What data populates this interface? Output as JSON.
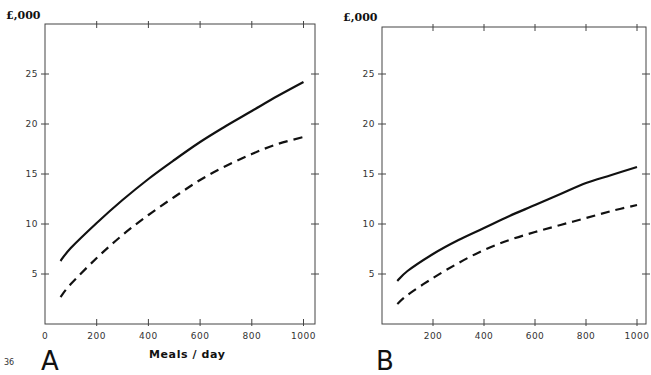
{
  "page_number": "36",
  "chart_data": [
    {
      "type": "line",
      "panel": "A",
      "title": "",
      "ylabel": "£,000",
      "xlabel": "Meals / day",
      "xlim": [
        0,
        1000
      ],
      "ylim": [
        0,
        30
      ],
      "x_ticks": [
        "0",
        "200",
        "400",
        "600",
        "800",
        "1000"
      ],
      "y_ticks": [
        "5",
        "10",
        "15",
        "20",
        "25"
      ],
      "grid": false,
      "series": [
        {
          "name": "solid",
          "style": "solid",
          "x": [
            60,
            100,
            200,
            300,
            400,
            500,
            600,
            700,
            800,
            900,
            1000
          ],
          "values": [
            6.3,
            7.6,
            10.1,
            12.4,
            14.5,
            16.4,
            18.2,
            19.8,
            21.3,
            22.8,
            24.2
          ]
        },
        {
          "name": "dashed",
          "style": "dashed",
          "x": [
            60,
            100,
            200,
            300,
            400,
            500,
            600,
            700,
            800,
            900,
            1000
          ],
          "values": [
            2.7,
            4.0,
            6.6,
            8.9,
            10.9,
            12.7,
            14.4,
            15.8,
            17.0,
            18.0,
            18.7
          ]
        }
      ]
    },
    {
      "type": "line",
      "panel": "B",
      "title": "",
      "ylabel": "£,000",
      "xlabel": "",
      "xlim": [
        0,
        1000
      ],
      "ylim": [
        0,
        30
      ],
      "x_ticks": [
        "200",
        "400",
        "600",
        "800",
        "1000"
      ],
      "y_ticks": [
        "5",
        "10",
        "15",
        "20",
        "25"
      ],
      "grid": false,
      "series": [
        {
          "name": "solid",
          "style": "solid",
          "x": [
            60,
            100,
            200,
            300,
            400,
            500,
            600,
            700,
            800,
            900,
            1000
          ],
          "values": [
            4.3,
            5.3,
            7.0,
            8.4,
            9.6,
            10.8,
            11.9,
            13.0,
            14.1,
            14.9,
            15.7
          ]
        },
        {
          "name": "dashed",
          "style": "dashed",
          "x": [
            60,
            100,
            200,
            300,
            400,
            500,
            600,
            700,
            800,
            900,
            1000
          ],
          "values": [
            2.0,
            2.9,
            4.6,
            6.1,
            7.4,
            8.4,
            9.2,
            9.9,
            10.6,
            11.3,
            11.9
          ]
        }
      ]
    }
  ],
  "panels": {
    "A": {
      "letter": "A",
      "unit": "£,000",
      "xlabel": "Meals / day",
      "x_tick_labels": [
        "0",
        "200",
        "400",
        "600",
        "800",
        "1000"
      ],
      "y_tick_labels": [
        "5",
        "10",
        "15",
        "20",
        "25"
      ]
    },
    "B": {
      "letter": "B",
      "unit": "£,000",
      "x_tick_labels": [
        "200",
        "400",
        "600",
        "800",
        "1000"
      ],
      "y_tick_labels": [
        "5",
        "10",
        "15",
        "20",
        "25"
      ]
    }
  }
}
